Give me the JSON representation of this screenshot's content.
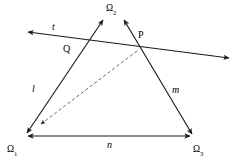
{
  "figure": {
    "background_color": "#ffffff",
    "stroke_color": "#1a1a1a",
    "dashed_stroke_color": "#555555",
    "width": 240,
    "height": 164
  },
  "points": {
    "Q": {
      "label": "Q",
      "x": 86,
      "y": 42,
      "label_x": 63,
      "label_y": 44
    },
    "P": {
      "label": "P",
      "x": 137,
      "y": 50,
      "label_x": 138,
      "label_y": 30
    }
  },
  "ideal_points": [
    {
      "name": "omega-2",
      "base": "Ω",
      "subscript": "2",
      "label_x": 106,
      "label_y": 4
    },
    {
      "name": "omega-1",
      "base": "Ω",
      "subscript": "1",
      "label_x": 7,
      "label_y": 145
    },
    {
      "name": "omega-3",
      "base": "Ω",
      "subscript": "3",
      "label_x": 193,
      "label_y": 145
    }
  ],
  "line_labels": [
    {
      "name": "line-t",
      "text": "t",
      "x": 52,
      "y": 22
    },
    {
      "name": "line-l",
      "text": "l",
      "x": 32,
      "y": 84
    },
    {
      "name": "line-m",
      "text": "m",
      "x": 172,
      "y": 85
    },
    {
      "name": "line-n",
      "text": "n",
      "x": 107,
      "y": 140
    }
  ],
  "segments": [
    {
      "name": "line-t-transversal",
      "from": {
        "x": 28,
        "y": 32
      },
      "to": {
        "x": 229,
        "y": 58
      },
      "style": "solid",
      "arrow_start": true,
      "arrow_end": true
    },
    {
      "name": "line-l-omega1-to-omega2",
      "from": {
        "x": 27,
        "y": 133
      },
      "to": {
        "x": 103,
        "y": 20
      },
      "style": "solid",
      "arrow_start": true,
      "arrow_end": true
    },
    {
      "name": "line-m-omega3-to-omega2",
      "from": {
        "x": 192,
        "y": 134
      },
      "to": {
        "x": 124,
        "y": 20
      },
      "style": "solid",
      "arrow_start": true,
      "arrow_end": true
    },
    {
      "name": "line-n-omega1-to-omega3",
      "from": {
        "x": 28,
        "y": 136
      },
      "to": {
        "x": 190,
        "y": 136
      },
      "style": "solid",
      "arrow_start": true,
      "arrow_end": true
    },
    {
      "name": "dashed-p-to-omega1",
      "from": {
        "x": 137,
        "y": 51
      },
      "to": {
        "x": 40,
        "y": 125
      },
      "style": "dashed",
      "arrow_start": false,
      "arrow_end": true
    }
  ]
}
